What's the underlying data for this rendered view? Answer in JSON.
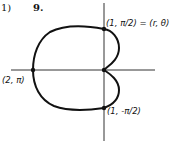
{
  "header": {
    "part_label": "1)",
    "problem_number": "9."
  },
  "diagram": {
    "type": "polar cardioid",
    "equation_implied": "r = 1 - cos(θ)",
    "labels": {
      "top_point": "(1, π/2) = (r, θ)",
      "left_point": "(2, π)",
      "bottom_point": "(1, -π/2)"
    },
    "points": [
      {
        "name": "top",
        "r": 1,
        "theta": "π/2"
      },
      {
        "name": "left",
        "r": 2,
        "theta": "π"
      },
      {
        "name": "bottom",
        "r": 1,
        "theta": "-π/2"
      },
      {
        "name": "pole",
        "r": 0,
        "theta": "0"
      }
    ],
    "colors": {
      "ink": "#111111",
      "background": "#ffffff"
    }
  }
}
